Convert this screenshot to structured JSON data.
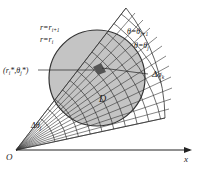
{
  "diagram": {
    "type": "polar-grid-region",
    "region_label": "D",
    "origin_label": "O",
    "axis_label": "x",
    "labels": {
      "r_next": "r=r_{i+1}",
      "r_cur": "r=r_i",
      "theta_next": "θ=θ_{j+1}",
      "theta_cur": "θ=θ_j",
      "point": "(r_i*, θ_j*)",
      "area_element": "Δσ_k",
      "delta_theta": "Δθ_j"
    },
    "colors": {
      "region_fill": "#c4c4c4",
      "element_fill": "#555555",
      "line": "#333333"
    }
  }
}
